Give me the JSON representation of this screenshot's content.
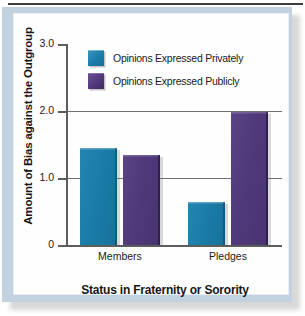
{
  "figure": {
    "top_caption": "",
    "accent_blue": "#1a7ca8",
    "accent_purple": "#50397a",
    "panel_background": "#c3d2e0",
    "plot_background": "#fefefe"
  },
  "chart_data": {
    "type": "bar",
    "title": "",
    "xlabel": "Status in Fraternity or Sorority",
    "ylabel": "Amount of Bias against the Outgroup",
    "categories": [
      "Members",
      "Pledges"
    ],
    "series": [
      {
        "name": "Opinions Expressed Privately",
        "color": "#1a7ca8",
        "values": [
          1.45,
          0.64
        ]
      },
      {
        "name": "Opinions Expressed Publicly",
        "color": "#50397a",
        "values": [
          1.35,
          1.98
        ]
      }
    ],
    "ylim": [
      0,
      3.0
    ],
    "yticks": [
      0,
      1.0,
      2.0,
      3.0
    ],
    "ytick_labels": [
      "0",
      "1.0",
      "2.0",
      "3.0"
    ],
    "gridlines": [
      1.0,
      2.0
    ],
    "grid": true,
    "legend_position": "top-center-inside"
  }
}
